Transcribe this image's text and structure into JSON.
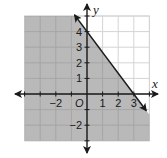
{
  "chart_data": {
    "type": "line",
    "title": "",
    "xlabel": "x",
    "ylabel": "y",
    "origin_label": "O",
    "xlim": [
      -4,
      4
    ],
    "ylim": [
      -3,
      5
    ],
    "grid": true,
    "x_tick_labels": [
      {
        "value": -2,
        "label": "−2"
      },
      {
        "value": 1,
        "label": "1"
      },
      {
        "value": 2,
        "label": "2"
      },
      {
        "value": 3,
        "label": "3"
      }
    ],
    "y_tick_labels": [
      {
        "value": 4,
        "label": "4"
      },
      {
        "value": 3,
        "label": "3"
      },
      {
        "value": 2,
        "label": "2"
      },
      {
        "value": 1,
        "label": "1"
      },
      {
        "value": -2,
        "label": "−2"
      }
    ],
    "series": [
      {
        "name": "boundary line",
        "style": "solid",
        "equation": "y = -4/3 x + 4",
        "points": [
          [
            0,
            4
          ],
          [
            3,
            0
          ]
        ],
        "arrow_ends": [
          [
            -0.8,
            5.07
          ],
          [
            3.8,
            -1.07
          ]
        ]
      }
    ],
    "shaded_region": {
      "inequality": "y ≤ -4/3 x + 4",
      "side": "below-left of line",
      "color": "#b9b9b9"
    }
  },
  "colors": {
    "shade": "#b9b9b9",
    "shade_grid": "#a6a6a6",
    "grid": "#d4d4d4",
    "axis": "#1a1a1a",
    "line": "#1a1a1a"
  }
}
